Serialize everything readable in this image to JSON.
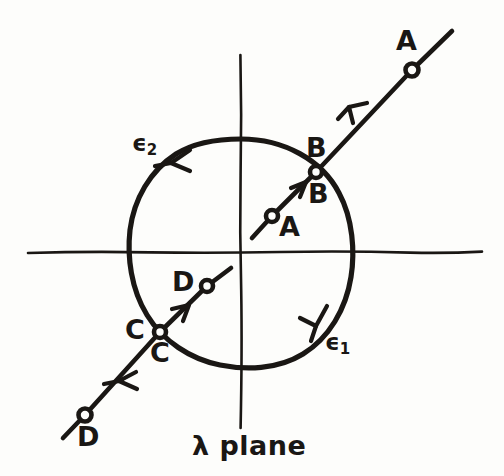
{
  "figure": {
    "kind": "hand-drawn contour integration diagram",
    "caption": "λ plane",
    "ink_color": "#1a1714",
    "background_color": "#fdfdfb",
    "geometry": {
      "origin_x": 241,
      "origin_y": 252,
      "circle_radius": 113,
      "h_axis_x1": 28,
      "h_axis_x2": 482,
      "v_axis_y1": 55,
      "v_axis_y2": 428
    },
    "labels": {
      "outer_a": "A",
      "inner_a": "A",
      "upper_b": "B",
      "lower_b": "B",
      "left_c": "C",
      "lower_c": "C",
      "inner_d": "D",
      "outer_d": "D",
      "epsilon_one": "ϵ",
      "epsilon_one_sub": "1",
      "epsilon_two": "ϵ",
      "epsilon_two_sub": "2"
    },
    "markers": [
      {
        "name": "outer-a-marker",
        "label": "A",
        "x": 412,
        "y": 70,
        "r": 6.5
      },
      {
        "name": "branch-b-marker",
        "label": "B",
        "x": 316,
        "y": 172,
        "r": 6.0
      },
      {
        "name": "inner-a-marker",
        "label": "A",
        "x": 272,
        "y": 216,
        "r": 6.0
      },
      {
        "name": "inner-d-marker",
        "label": "D",
        "x": 207,
        "y": 286,
        "r": 6.0
      },
      {
        "name": "branch-c-marker",
        "label": "C",
        "x": 160,
        "y": 332,
        "r": 6.0
      },
      {
        "name": "outer-d-marker",
        "label": "D",
        "x": 85,
        "y": 415,
        "r": 6.5
      }
    ],
    "arrows": [
      {
        "name": "ab-outer-arrow",
        "direction": "down-left",
        "x": 350,
        "y": 106
      },
      {
        "name": "ab-inner-arrow",
        "direction": "up-right",
        "x": 303,
        "y": 185
      },
      {
        "name": "epsilon2-arc-arrow",
        "direction": "down-left",
        "x": 172,
        "y": 162
      },
      {
        "name": "epsilon1-arc-arrow",
        "direction": "down-left",
        "x": 315,
        "y": 325
      },
      {
        "name": "cd-inner-arrow",
        "direction": "up-right",
        "x": 185,
        "y": 310
      },
      {
        "name": "cd-outer-arrow",
        "direction": "down-left",
        "x": 120,
        "y": 380
      }
    ]
  }
}
